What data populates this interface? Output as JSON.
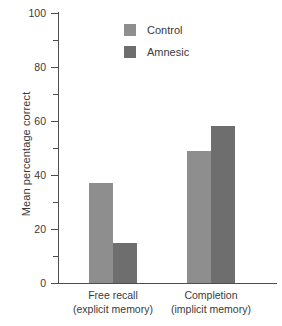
{
  "chart_data": {
    "type": "bar",
    "title": "",
    "subtitle": "",
    "xlabel": "",
    "ylabel": "Mean percentage correct",
    "ylim": [
      0,
      100
    ],
    "grid": false,
    "legend_position": "top-center",
    "categories": [
      {
        "line1": "Free recall",
        "line2": "(explicit memory)"
      },
      {
        "line1": "Completion",
        "line2": "(implicit memory)"
      }
    ],
    "y_ticks_major": [
      "0",
      "20",
      "40",
      "60",
      "80",
      "100"
    ],
    "y_ticks_major_values": [
      0,
      20,
      40,
      60,
      80,
      100
    ],
    "y_ticks_minor_values": [
      10,
      30,
      50,
      70,
      90
    ],
    "series": [
      {
        "name": "Control",
        "color": "#8e8e8e",
        "values": [
          37,
          49
        ]
      },
      {
        "name": "Amnesic",
        "color": "#6e6e6e",
        "values": [
          15,
          58
        ]
      }
    ]
  },
  "legend": {
    "items": [
      {
        "label": "Control"
      },
      {
        "label": "Amnesic"
      }
    ]
  },
  "axis": {
    "y_title": "Mean percentage correct",
    "tick_0": "0",
    "tick_20": "20",
    "tick_40": "40",
    "tick_60": "60",
    "tick_80": "80",
    "tick_100": "100"
  },
  "categories": {
    "group1_line1": "Free recall",
    "group1_line2": "(explicit memory)",
    "group2_line1": "Completion",
    "group2_line2": "(implicit memory)"
  }
}
